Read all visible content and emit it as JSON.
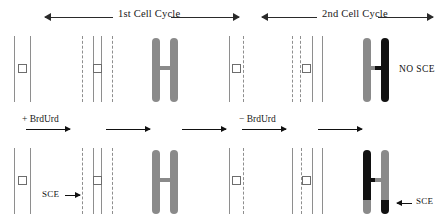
{
  "figure": {
    "title_top_left": "1st Cell Cycle",
    "title_top_right": "2nd Cell Cycle",
    "label_plus_brdurd": "+ BrdUrd",
    "label_minus_brdurd": "− BrdUrd",
    "label_no_sce": "NO SCE",
    "label_sce_left": "SCE",
    "label_sce_right": "SCE",
    "arrow_left_icon": "arrow-left-icon",
    "arrow_right_icon": "arrow-right-icon",
    "centromere_icon": "centromere-square-icon",
    "colors": {
      "chromatid_gray": "#8a8a8a",
      "chromatid_black": "#111111",
      "strand_line": "#8e8e8e",
      "text": "#181818",
      "background": "#ffffff"
    },
    "rows": [
      {
        "name": "no-sce-row",
        "outcome": "NO SCE",
        "stages": [
          {
            "stage": "unreplicated-dna",
            "strands": [
              "solid",
              "solid"
            ],
            "centromere": true
          },
          {
            "stage": "replicated-dna-brdurd",
            "strands": [
              "dashed",
              "solid",
              "solid",
              "dashed"
            ],
            "centromere": true
          },
          {
            "stage": "metaphase-chromosome",
            "chromatids": [
              "gray",
              "gray"
            ]
          },
          {
            "stage": "single-chromatid-dna",
            "strands": [
              "solid",
              "dashed"
            ],
            "centromere": true
          },
          {
            "stage": "replicated-dna-no-brdurd",
            "strands": [
              "dashed",
              "dashed",
              "solid",
              "dashed"
            ],
            "centromere": true
          },
          {
            "stage": "metaphase-chromosome-differential",
            "chromatids": [
              "gray",
              "black"
            ]
          }
        ]
      },
      {
        "name": "sce-row",
        "outcome": "SCE",
        "stages": [
          {
            "stage": "unreplicated-dna",
            "strands": [
              "solid",
              "solid"
            ],
            "centromere": true
          },
          {
            "stage": "replicated-dna-brdurd-exchange",
            "strands": [
              "dashed",
              "solid",
              "solid",
              "dashed"
            ],
            "centromere": true,
            "exchange_point": true
          },
          {
            "stage": "metaphase-chromosome",
            "chromatids": [
              "gray",
              "gray"
            ]
          },
          {
            "stage": "single-chromatid-dna",
            "strands": [
              "solid",
              "dashed"
            ],
            "centromere": true
          },
          {
            "stage": "replicated-dna-no-brdurd",
            "strands": [
              "solid",
              "dashed",
              "solid",
              "solid"
            ],
            "centromere": true
          },
          {
            "stage": "metaphase-chromosome-sce",
            "chromatids": [
              "black-with-gray-tip",
              "gray-with-black-tip"
            ]
          }
        ]
      }
    ]
  }
}
